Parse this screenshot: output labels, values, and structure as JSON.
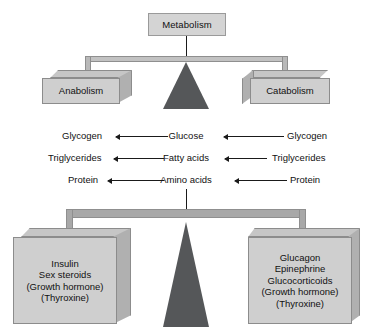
{
  "diagram": {
    "colors": {
      "box_fill": "#cfcfcf",
      "box_edge": "#8c8c8c",
      "beam_fill": "#b9b9b9",
      "fulcrum": "#555759",
      "line": "#1a1a1a",
      "background": "#ffffff"
    }
  },
  "top_scale": {
    "apex_label": "Metabolism",
    "left_pan_label": "Anabolism",
    "right_pan_label": "Catabolism"
  },
  "metabolite_rows": [
    {
      "left": "Glycogen",
      "center": "Glucose",
      "right": "Glycogen",
      "left_arrow_direction": "left",
      "right_arrow_direction": "left"
    },
    {
      "left": "Triglycerides",
      "center": "Fatty acids",
      "right": "Triglycerides",
      "left_arrow_direction": "left",
      "right_arrow_direction": "left"
    },
    {
      "left": "Protein",
      "center": "Amino acids",
      "right": "Protein",
      "left_arrow_direction": "left",
      "right_arrow_direction": "left"
    }
  ],
  "bottom_scale": {
    "left_pan_lines": [
      "Insulin",
      "Sex steroids",
      "(Growth hormone)",
      "(Thyroxine)"
    ],
    "right_pan_lines": [
      "Glucagon",
      "Epinephrine",
      "Glucocorticoids",
      "(Growth hormone)",
      "(Thyroxine)"
    ]
  }
}
